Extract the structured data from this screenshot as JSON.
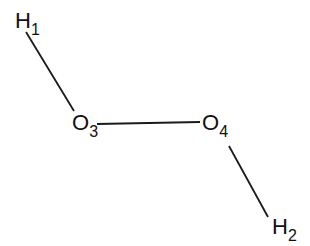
{
  "diagram": {
    "type": "molecular-structure",
    "atoms": [
      {
        "id": "H1",
        "symbol": "H",
        "subscript": "1"
      },
      {
        "id": "O3",
        "symbol": "O",
        "subscript": "3"
      },
      {
        "id": "O4",
        "symbol": "O",
        "subscript": "4"
      },
      {
        "id": "H2",
        "symbol": "H",
        "subscript": "2"
      }
    ],
    "bonds": [
      {
        "from": "H1",
        "to": "O3"
      },
      {
        "from": "O3",
        "to": "O4"
      },
      {
        "from": "O4",
        "to": "H2"
      }
    ]
  }
}
